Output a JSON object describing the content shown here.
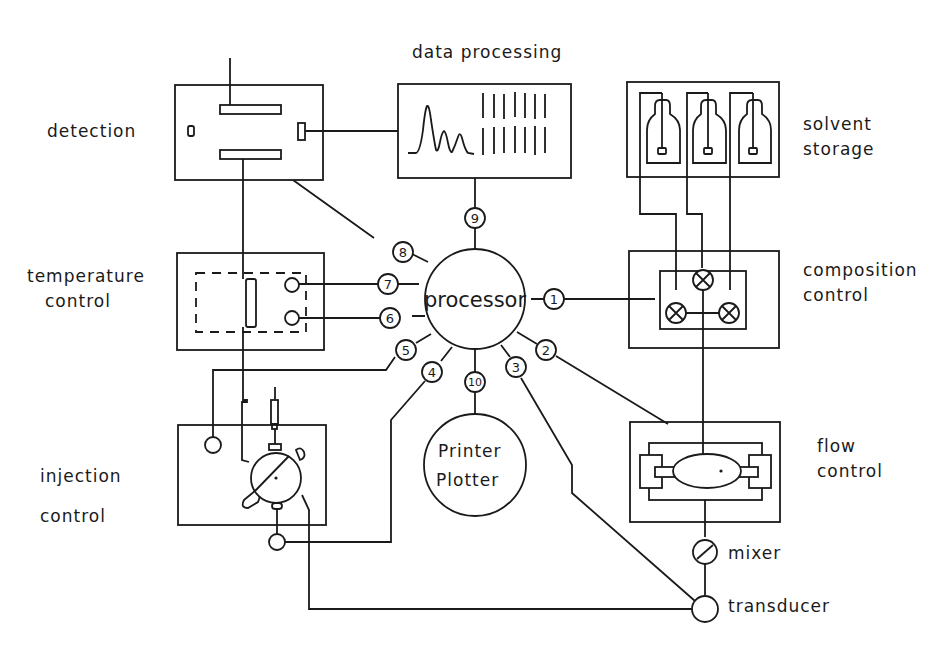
{
  "diagram": {
    "colors": {
      "ink": "#1a1a1a",
      "background": "#ffffff"
    },
    "center": {
      "label": "processor"
    },
    "output_device": {
      "line1": "Printer",
      "line2": "Plotter"
    },
    "modules": {
      "data_processing": {
        "label": "data processing"
      },
      "detection": {
        "label": "detection"
      },
      "solvent_storage": {
        "line1": "solvent",
        "line2": "storage"
      },
      "temperature_control": {
        "line1": "temperature",
        "line2": "control"
      },
      "composition_control": {
        "line1": "composition",
        "line2": "control"
      },
      "injection_control": {
        "line1": "injection",
        "line2": "control"
      },
      "flow_control": {
        "line1": "flow",
        "line2": "control"
      },
      "mixer": {
        "label": "mixer"
      },
      "transducer": {
        "label": "transducer"
      }
    },
    "connectors": [
      "1",
      "2",
      "3",
      "4",
      "5",
      "6",
      "7",
      "8",
      "9",
      "10"
    ]
  }
}
